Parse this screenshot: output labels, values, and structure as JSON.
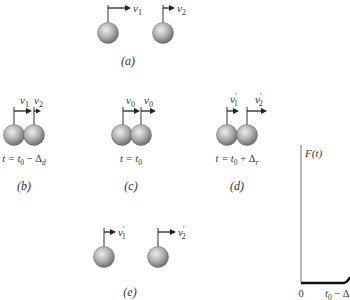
{
  "figure": {
    "panels": [
      {
        "id": "a",
        "caption": "(a)",
        "time_label": "",
        "velocities": [
          "v1",
          "v2"
        ],
        "arrow_labels": [
          {
            "main": "v",
            "sub": "1",
            "prime": ""
          },
          {
            "main": "v",
            "sub": "2",
            "prime": ""
          }
        ],
        "balls_touching": false
      },
      {
        "id": "b",
        "caption": "(b)",
        "time_label": "t = t0 − Δd",
        "time_parts": {
          "pre": "t = t",
          "sub": "0",
          "mid": " − Δ",
          "sub2": "d"
        },
        "arrow_labels": [
          {
            "main": "v",
            "sub": "1",
            "prime": ""
          },
          {
            "main": "v",
            "sub": "2",
            "prime": ""
          }
        ],
        "balls_touching": true
      },
      {
        "id": "c",
        "caption": "(c)",
        "time_label": "t = t0",
        "time_parts": {
          "pre": "t = t",
          "sub": "0",
          "mid": "",
          "sub2": ""
        },
        "arrow_labels": [
          {
            "main": "v",
            "sub": "0",
            "prime": ""
          },
          {
            "main": "v",
            "sub": "0",
            "prime": ""
          }
        ],
        "balls_touching": true
      },
      {
        "id": "d",
        "caption": "(d)",
        "time_label": "t = t0 + Δr",
        "time_parts": {
          "pre": "t = t",
          "sub": "0",
          "mid": " + Δ",
          "sub2": "r"
        },
        "arrow_labels": [
          {
            "main": "v",
            "sub": "1",
            "prime": "′"
          },
          {
            "main": "v",
            "sub": "2",
            "prime": "′"
          }
        ],
        "balls_touching": true
      },
      {
        "id": "e",
        "caption": "(e)",
        "time_label": "",
        "arrow_labels": [
          {
            "main": "v",
            "sub": "1",
            "prime": "′"
          },
          {
            "main": "v",
            "sub": "2",
            "prime": "′"
          }
        ],
        "balls_touching": false
      }
    ],
    "graph": {
      "y_label": "F(t)",
      "x_origin_label": "0",
      "x_tick_label": "t0 − Δ",
      "x_tick_parts": {
        "pre": "t",
        "sub": "0",
        "post": " − Δ"
      }
    },
    "colors": {
      "ball_light": "#e6e6e6",
      "ball_dark": "#7a7a7a",
      "line": "#222222",
      "axis": "#888888"
    }
  }
}
